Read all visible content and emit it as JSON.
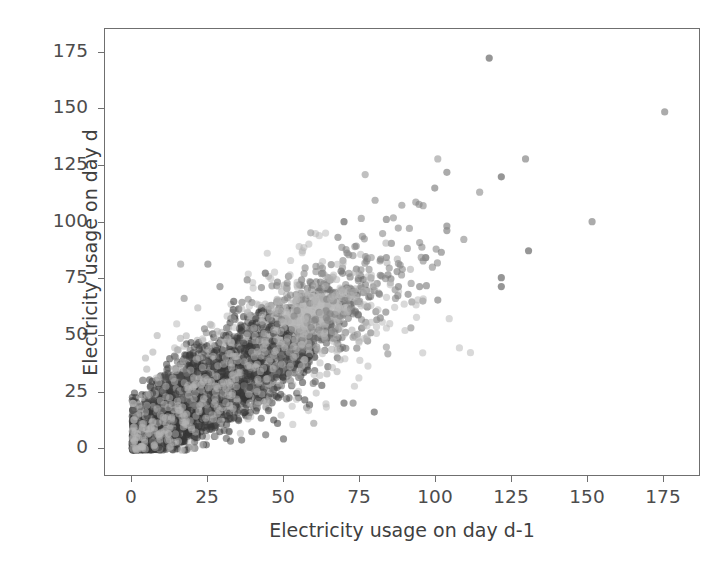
{
  "figure": {
    "background_color": "#ffffff",
    "width": 728,
    "height": 570
  },
  "chart_data": {
    "type": "scatter",
    "title": "",
    "xlabel": "Electricity usage on day d-1",
    "ylabel": "Electricity usage on day d",
    "xlim": [
      -9,
      188
    ],
    "ylim": [
      -12,
      188
    ],
    "xticks": [
      0,
      25,
      50,
      75,
      100,
      125,
      150,
      175
    ],
    "xticklabels": [
      "0",
      "25",
      "50",
      "75",
      "100",
      "125",
      "150",
      "175"
    ],
    "yticks": [
      0,
      25,
      50,
      75,
      100,
      125,
      150,
      175
    ],
    "yticklabels": [
      "0",
      "25",
      "50",
      "75",
      "100",
      "125",
      "150",
      "175"
    ],
    "grid": false,
    "legend": null,
    "marker": {
      "shape": "circle",
      "size_px": 7.2,
      "alpha": 0.55,
      "colors": [
        "#3a3a3a",
        "#8f8f8f",
        "#b9b9b9"
      ]
    },
    "correlation": 0.78,
    "n_points": 3500,
    "clusters": [
      {
        "name": "dense-core",
        "center": [
          18,
          20
        ],
        "sx": 13,
        "sy": 12,
        "n": 1500,
        "color": "#3a3a3a",
        "rho": 0.72
      },
      {
        "name": "mid-band",
        "center": [
          35,
          36
        ],
        "sx": 15,
        "sy": 14,
        "n": 900,
        "color": "#4a4a4a",
        "rho": 0.76
      },
      {
        "name": "upper-band",
        "center": [
          52,
          52
        ],
        "sx": 14,
        "sy": 13,
        "n": 500,
        "color": "#6a6a6a",
        "rho": 0.74
      },
      {
        "name": "light-cluster",
        "center": [
          58,
          60
        ],
        "sx": 7,
        "sy": 5,
        "n": 260,
        "color": "#bcbcbc",
        "rho": 0.55
      },
      {
        "name": "light-halo",
        "center": [
          40,
          42
        ],
        "sx": 18,
        "sy": 17,
        "n": 280,
        "color": "#a9a9a9",
        "rho": 0.7
      },
      {
        "name": "sparse-tail",
        "center": [
          72,
          72
        ],
        "sx": 16,
        "sy": 16,
        "n": 120,
        "color": "#7d7d7d",
        "rho": 0.6
      }
    ],
    "outliers": [
      [
        118,
        175
      ],
      [
        176,
        151
      ],
      [
        101,
        130
      ],
      [
        130,
        130
      ],
      [
        104,
        124
      ],
      [
        77,
        123
      ],
      [
        122,
        122
      ],
      [
        100,
        117
      ],
      [
        152,
        102
      ],
      [
        84,
        103
      ],
      [
        70,
        102
      ],
      [
        104,
        100
      ],
      [
        104,
        98
      ],
      [
        59,
        97
      ],
      [
        68,
        95
      ],
      [
        131,
        89
      ],
      [
        97,
        86
      ],
      [
        84,
        86
      ],
      [
        79,
        86
      ],
      [
        71,
        88
      ],
      [
        122,
        77
      ],
      [
        88,
        73
      ],
      [
        95,
        73
      ],
      [
        122,
        73
      ],
      [
        101,
        67
      ],
      [
        82,
        59
      ],
      [
        84,
        46
      ],
      [
        80,
        17
      ],
      [
        60,
        12
      ],
      [
        50,
        5
      ],
      [
        70,
        21
      ],
      [
        73,
        21
      ],
      [
        16,
        83
      ],
      [
        25,
        83
      ],
      [
        29,
        73
      ],
      [
        38,
        76
      ],
      [
        56,
        76
      ],
      [
        44,
        79
      ],
      [
        48,
        75
      ],
      [
        63,
        79
      ]
    ]
  },
  "axes": {
    "spine_color": "#6f6f6f",
    "tick_color": "#6f6f6f",
    "label_color": "#4c4c4c",
    "title_color": "#3f3f3f"
  }
}
